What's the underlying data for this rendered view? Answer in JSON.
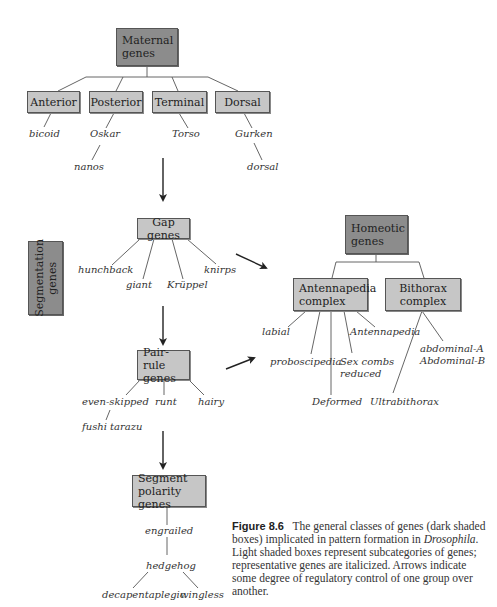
{
  "boxes": {
    "maternal": "Maternal genes",
    "anterior": "Anterior",
    "posterior": "Posterior",
    "terminal": "Terminal",
    "dorsal": "Dorsal",
    "segmentation": "Segmentation genes",
    "gap": "Gap genes",
    "pair_rule": "Pair-rule genes",
    "segment_polarity": "Segment polarity genes",
    "homeotic": "Homeotic genes",
    "antennapedia": "Antennapedia complex",
    "bithorax": "Bithorax complex"
  },
  "genes": {
    "bicoid": "bicoid",
    "oskar": "Oskar",
    "nanos": "nanos",
    "torso": "Torso",
    "gurken": "Gurken",
    "dorsal": "dorsal",
    "hunchback": "hunchback",
    "giant": "giant",
    "kruppel": "Krüppel",
    "knirps": "knirps",
    "even_skipped": "even-skipped",
    "fushi_tarazu": "fushi tarazu",
    "runt": "runt",
    "hairy": "hairy",
    "engrailed": "engrailed",
    "hedgehog": "hedgehog",
    "decapentaplegic": "decapentaplegic",
    "wingless": "wingless",
    "labial": "labial",
    "proboscipedia": "proboscipedia",
    "deformed": "Deformed",
    "sex_combs_1": "Sex combs",
    "sex_combs_2": "reduced",
    "antennapedia": "Antennapedia",
    "abdominal_a": "abdominal-A",
    "abdominal_b": "Abdominal-B",
    "ultrabithorax": "Ultrabithorax"
  },
  "caption": {
    "label": "Figure 8.6",
    "text_1": "The general classes of genes (dark shaded boxes) implicated in pattern formation in ",
    "organism": "Drosophila",
    "text_2": ". Light shaded boxes represent subcategories of genes; representative genes are italicized. Arrows indicate some degree of regulatory control of one group over another."
  },
  "colors": {
    "dark_box": "#8c8c8c",
    "light_box": "#c6c6c6"
  }
}
